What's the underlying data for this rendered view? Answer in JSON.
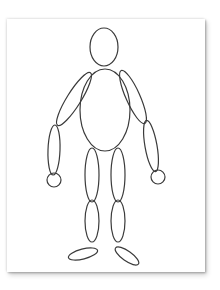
{
  "figure": {
    "title": "",
    "stroke_color": "#3a3a3a",
    "card_color": "#ffffff",
    "parts": [
      {
        "name": "head",
        "shape": "ellipse",
        "cx": 104,
        "cy": 47,
        "rx": 14,
        "ry": 19,
        "rotate": 0
      },
      {
        "name": "torso",
        "shape": "ellipse",
        "cx": 105,
        "cy": 110,
        "rx": 25,
        "ry": 41,
        "rotate": 0
      },
      {
        "name": "left-upper-arm",
        "shape": "ellipse",
        "cx": 74,
        "cy": 99,
        "rx": 7,
        "ry": 31,
        "rotate": 32
      },
      {
        "name": "left-forearm",
        "shape": "ellipse",
        "cx": 54,
        "cy": 150,
        "rx": 6,
        "ry": 25,
        "rotate": 2
      },
      {
        "name": "left-hand",
        "shape": "circle",
        "cx": 54,
        "cy": 180,
        "r": 7
      },
      {
        "name": "right-upper-arm",
        "shape": "ellipse",
        "cx": 133,
        "cy": 97,
        "rx": 7,
        "ry": 29,
        "rotate": -24
      },
      {
        "name": "right-forearm",
        "shape": "ellipse",
        "cx": 151,
        "cy": 146,
        "rx": 6,
        "ry": 26,
        "rotate": -10
      },
      {
        "name": "right-hand",
        "shape": "circle",
        "cx": 158,
        "cy": 177,
        "r": 7
      },
      {
        "name": "left-thigh",
        "shape": "ellipse",
        "cx": 92,
        "cy": 175,
        "rx": 7,
        "ry": 27,
        "rotate": 0
      },
      {
        "name": "left-shin",
        "shape": "ellipse",
        "cx": 92,
        "cy": 221,
        "rx": 7,
        "ry": 21,
        "rotate": 0
      },
      {
        "name": "left-foot",
        "shape": "ellipse",
        "cx": 83,
        "cy": 254,
        "rx": 15,
        "ry": 5,
        "rotate": -14
      },
      {
        "name": "right-thigh",
        "shape": "ellipse",
        "cx": 118,
        "cy": 175,
        "rx": 7,
        "ry": 27,
        "rotate": 0
      },
      {
        "name": "right-shin",
        "shape": "ellipse",
        "cx": 118,
        "cy": 221,
        "rx": 7,
        "ry": 21,
        "rotate": 0
      },
      {
        "name": "right-foot",
        "shape": "ellipse",
        "cx": 127,
        "cy": 256,
        "rx": 14,
        "ry": 5,
        "rotate": 35
      }
    ]
  }
}
